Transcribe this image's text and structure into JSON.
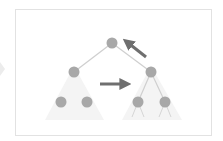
{
  "diagram": {
    "type": "binary-tree-rotation",
    "colors": {
      "node": "#a8a8a8",
      "edge": "#cfcfcf",
      "arrow": "#6f6f6f",
      "subtree_shade": "#f3f3f3",
      "frame_border": "#e2e2e2",
      "side_chevron": "#e6e6e6"
    },
    "nodes": [
      {
        "id": "root",
        "x": 112,
        "y": 43
      },
      {
        "id": "left",
        "x": 74,
        "y": 72
      },
      {
        "id": "right",
        "x": 151,
        "y": 72
      },
      {
        "id": "left-left",
        "x": 61,
        "y": 102
      },
      {
        "id": "left-right",
        "x": 87,
        "y": 102
      },
      {
        "id": "right-left",
        "x": 138,
        "y": 102
      },
      {
        "id": "right-right",
        "x": 165,
        "y": 102
      }
    ],
    "edges": [
      [
        "root",
        "left"
      ],
      [
        "root",
        "right"
      ],
      [
        "right",
        "right-left"
      ],
      [
        "right",
        "right-right"
      ]
    ],
    "arrows": [
      {
        "name": "rotate-up-arrow",
        "from": [
          146,
          57
        ],
        "to": [
          127,
          42
        ]
      },
      {
        "name": "shift-right-arrow",
        "from": [
          100,
          84
        ],
        "to": [
          126,
          84
        ]
      }
    ]
  }
}
